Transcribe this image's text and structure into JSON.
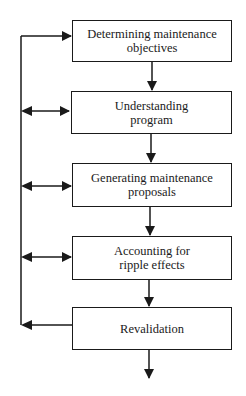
{
  "diagram": {
    "type": "flowchart",
    "colors": {
      "stroke": "#1a1a1a",
      "background": "#ffffff"
    },
    "steps": [
      {
        "id": "step1",
        "label": "Determining maintenance objectives"
      },
      {
        "id": "step2",
        "label": "Understanding program"
      },
      {
        "id": "step3",
        "label": "Generating maintenance proposals"
      },
      {
        "id": "step4",
        "label": "Accounting for ripple effects"
      },
      {
        "id": "step5",
        "label": "Revalidation"
      }
    ],
    "connections": [
      {
        "from": "step1",
        "to": "step2",
        "kind": "down-arrow"
      },
      {
        "from": "step2",
        "to": "step3",
        "kind": "down-arrow"
      },
      {
        "from": "step3",
        "to": "step4",
        "kind": "down-arrow"
      },
      {
        "from": "step4",
        "to": "step5",
        "kind": "down-arrow"
      },
      {
        "from": "step5",
        "to": "exit",
        "kind": "down-arrow"
      },
      {
        "from": "feedback-line",
        "to": "step1",
        "kind": "right-arrow"
      },
      {
        "from": "feedback-line",
        "to": "step2",
        "kind": "double-arrow"
      },
      {
        "from": "feedback-line",
        "to": "step3",
        "kind": "double-arrow"
      },
      {
        "from": "feedback-line",
        "to": "step4",
        "kind": "double-arrow"
      },
      {
        "from": "step5",
        "to": "feedback-line",
        "kind": "left-arrow"
      }
    ]
  }
}
